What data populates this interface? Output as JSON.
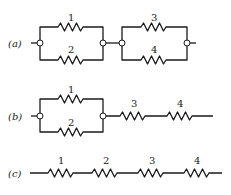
{
  "diagram": {
    "type": "resistor-circuits",
    "colors": {
      "line": "#1a1a1a",
      "background": "#ffffff"
    },
    "circuits": [
      {
        "caption": "(a)",
        "description": "Two parallel pairs in series: (1 || 2) + (3 || 4)",
        "resistors": [
          "1",
          "2",
          "3",
          "4"
        ]
      },
      {
        "caption": "(b)",
        "description": "Parallel pair (1 || 2) in series with 3 and 4",
        "resistors": [
          "1",
          "2",
          "3",
          "4"
        ]
      },
      {
        "caption": "(c)",
        "description": "Four resistors in series: 1 + 2 + 3 + 4",
        "resistors": [
          "1",
          "2",
          "3",
          "4"
        ]
      }
    ]
  }
}
